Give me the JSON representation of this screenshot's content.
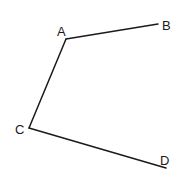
{
  "diagram": {
    "points": {
      "A": {
        "label": "A",
        "x": 66,
        "y": 39
      },
      "B": {
        "label": "B",
        "x": 158,
        "y": 24
      },
      "C": {
        "label": "C",
        "x": 29,
        "y": 128
      },
      "D": {
        "label": "D",
        "x": 166,
        "y": 168
      }
    },
    "segments": [
      {
        "from": "A",
        "to": "B"
      },
      {
        "from": "A",
        "to": "C"
      },
      {
        "from": "C",
        "to": "D"
      }
    ],
    "line_color": "#1a1a1a",
    "background": "#ffffff"
  }
}
